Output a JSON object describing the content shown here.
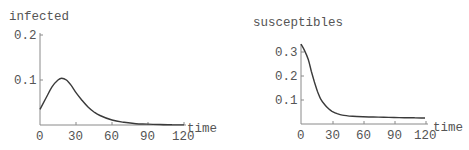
{
  "chart_data": [
    {
      "type": "line",
      "title": "infected",
      "xlabel": "time",
      "ylabel": "infected",
      "xlim": [
        0,
        120
      ],
      "ylim": [
        0,
        0.2
      ],
      "x_ticks": [
        "0",
        "30",
        "60",
        "90",
        "120"
      ],
      "y_ticks": [
        "0.1",
        "0.2"
      ],
      "grid": false,
      "series": [
        {
          "name": "infected",
          "x": [
            0,
            5,
            10,
            15,
            18,
            22,
            26,
            30,
            35,
            40,
            45,
            50,
            60,
            70,
            80,
            90,
            100,
            110,
            120
          ],
          "values": [
            0.035,
            0.06,
            0.085,
            0.1,
            0.104,
            0.1,
            0.088,
            0.072,
            0.055,
            0.04,
            0.029,
            0.021,
            0.011,
            0.006,
            0.003,
            0.002,
            0.001,
            0.0005,
            0.0003
          ]
        }
      ]
    },
    {
      "type": "line",
      "title": "susceptibles",
      "xlabel": "time",
      "ylabel": "susceptibles",
      "xlim": [
        0,
        120
      ],
      "ylim": [
        0,
        0.33
      ],
      "x_ticks": [
        "0",
        "30",
        "60",
        "90",
        "120"
      ],
      "y_ticks": [
        "0.1",
        "0.2",
        "0.3"
      ],
      "grid": false,
      "series": [
        {
          "name": "susceptibles",
          "x": [
            0,
            3,
            7,
            10,
            13,
            16,
            19,
            23,
            27,
            30,
            35,
            40,
            50,
            60,
            70,
            80,
            90,
            100,
            110,
            120
          ],
          "values": [
            0.333,
            0.31,
            0.27,
            0.22,
            0.175,
            0.135,
            0.105,
            0.08,
            0.062,
            0.053,
            0.043,
            0.037,
            0.032,
            0.03,
            0.029,
            0.028,
            0.027,
            0.026,
            0.026,
            0.025
          ]
        }
      ]
    }
  ],
  "panels": [
    {
      "title": "infected",
      "xlabel": "time",
      "x_tick_labels": [
        "0",
        "30",
        "60",
        "90",
        "120"
      ],
      "y_tick_labels": [
        "0.1",
        "0.2"
      ]
    },
    {
      "title": "susceptibles",
      "xlabel": "time",
      "x_tick_labels": [
        "0",
        "30",
        "60",
        "90",
        "120"
      ],
      "y_tick_labels": [
        "0.1",
        "0.2",
        "0.3"
      ]
    }
  ]
}
